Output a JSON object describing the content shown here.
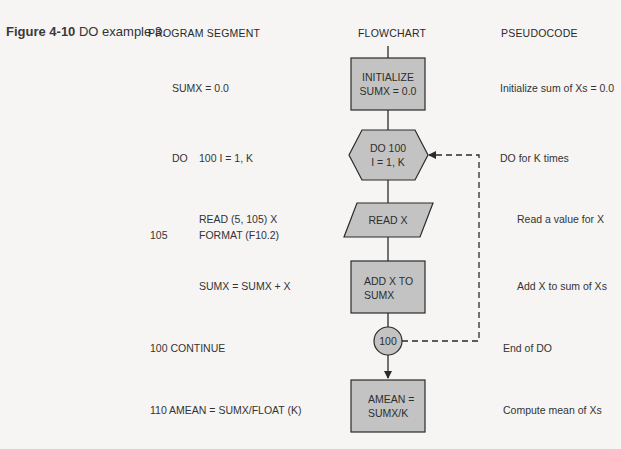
{
  "caption": {
    "figure_number": "Figure 4-10",
    "title": "DO example 3."
  },
  "headers": {
    "program_segment": "PROGRAM SEGMENT",
    "flowchart": "FLOWCHART",
    "pseudocode": "PSEUDOCODE"
  },
  "program_segment": [
    {
      "label": "",
      "code": "SUMX = 0.0"
    },
    {
      "label": "DO",
      "code": "100 I = 1, K"
    },
    {
      "label": "",
      "code": "READ (5, 105) X"
    },
    {
      "label": "105",
      "code": "FORMAT (F10.2)"
    },
    {
      "label": "",
      "code": "SUMX = SUMX + X"
    },
    {
      "label": "",
      "code": "100 CONTINUE"
    },
    {
      "label": "",
      "code": "110 AMEAN = SUMX/FLOAT (K)"
    }
  ],
  "flowchart": {
    "fill_color": "#c3c3c3",
    "stroke_color": "#2a2a2a",
    "nodes": [
      {
        "id": "init",
        "shape": "process",
        "lines": [
          "INITIALIZE",
          "SUMX  =  0.0"
        ]
      },
      {
        "id": "do",
        "shape": "preparation-hexagon",
        "lines": [
          "DO 100",
          "I = 1, K"
        ]
      },
      {
        "id": "read",
        "shape": "input-parallelogram",
        "lines": [
          "READ X"
        ]
      },
      {
        "id": "add",
        "shape": "process",
        "lines": [
          "ADD X TO",
          "SUMX"
        ]
      },
      {
        "id": "continue",
        "shape": "connector-circle",
        "lines": [
          "100"
        ]
      },
      {
        "id": "mean",
        "shape": "process",
        "lines": [
          "AMEAN =",
          "SUMX/K"
        ]
      }
    ],
    "edges": [
      {
        "from": "init",
        "to": "do",
        "style": "solid"
      },
      {
        "from": "do",
        "to": "read",
        "style": "solid"
      },
      {
        "from": "read",
        "to": "add",
        "style": "solid"
      },
      {
        "from": "add",
        "to": "continue",
        "style": "solid"
      },
      {
        "from": "continue",
        "to": "mean",
        "style": "solid-arrow"
      },
      {
        "from": "continue",
        "to": "do",
        "style": "dashed-loop-arrow"
      }
    ]
  },
  "pseudocode": [
    "Initialize sum of Xs = 0.0",
    "DO for K times",
    "Read a value for X",
    "Add X to sum of Xs",
    "End of DO",
    "Compute mean of Xs"
  ]
}
